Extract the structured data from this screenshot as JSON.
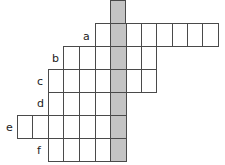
{
  "puzzle": {
    "type": "crossword-vertical-keyword",
    "shaded_color": "#c4c4c4",
    "line_color": "#4a4a4a",
    "cell_width": 15.5,
    "row_height": 23,
    "column_edges_x": [
      17,
      32,
      48,
      63,
      79,
      95,
      110,
      126,
      141,
      156,
      172,
      187,
      202,
      218
    ],
    "shaded_column_index": 6,
    "spine": {
      "x": 110,
      "y": 0,
      "width": 16,
      "height": 160
    },
    "rows": [
      {
        "label": "a",
        "top": 23,
        "start_col": 5,
        "end_col": 12,
        "label_x": 83,
        "label_y": 31
      },
      {
        "label": "b",
        "top": 46,
        "start_col": 3,
        "end_col": 8,
        "label_x": 52,
        "label_y": 53
      },
      {
        "label": "c",
        "top": 69,
        "start_col": 2,
        "end_col": 8,
        "label_x": 37,
        "label_y": 76
      },
      {
        "label": "d",
        "top": 92,
        "start_col": 2,
        "end_col": 6,
        "label_x": 37,
        "label_y": 98
      },
      {
        "label": "e",
        "top": 115,
        "start_col": 0,
        "end_col": 6,
        "label_x": 6,
        "label_y": 122
      },
      {
        "label": "f",
        "top": 138,
        "start_col": 2,
        "end_col": 6,
        "label_x": 37,
        "label_y": 145
      }
    ]
  }
}
